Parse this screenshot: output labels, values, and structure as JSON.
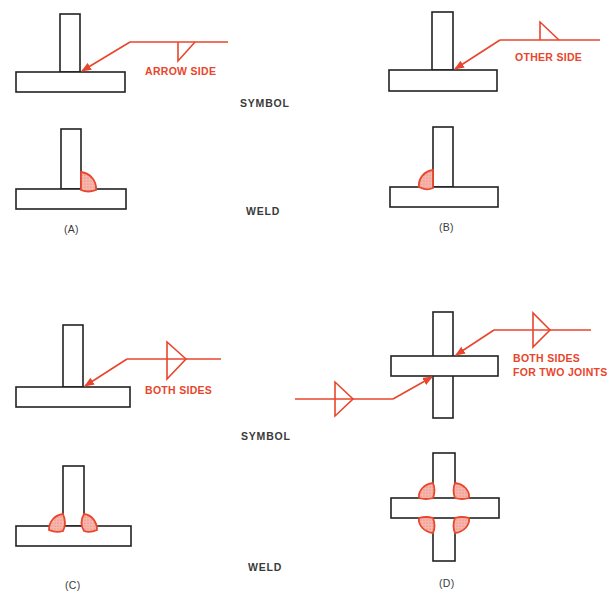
{
  "colors": {
    "line": "#222222",
    "accent": "#e8452c",
    "weld_fill": "#f4a9a0"
  },
  "row_labels": {
    "symbol_top": "SYMBOL",
    "weld_top": "WELD",
    "symbol_bottom": "SYMBOL",
    "weld_bottom": "WELD"
  },
  "panels": [
    {
      "id": "A",
      "caption": "(A)",
      "symbol_note": "ARROW SIDE",
      "weld_count": 1
    },
    {
      "id": "B",
      "caption": "(B)",
      "symbol_note": "OTHER SIDE",
      "weld_count": 1
    },
    {
      "id": "C",
      "caption": "(C)",
      "symbol_note": "BOTH SIDES",
      "weld_count": 2
    },
    {
      "id": "D",
      "caption": "(D)",
      "symbol_note_line1": "BOTH SIDES",
      "symbol_note_line2": "FOR TWO JOINTS",
      "weld_count": 4
    }
  ]
}
